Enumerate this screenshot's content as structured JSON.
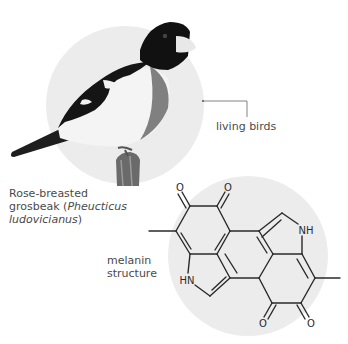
{
  "diagram": {
    "bird_section": {
      "callout_label": "living birds",
      "caption": {
        "line1": "Rose-breasted",
        "line2_prefix": "grosbeak (",
        "line2_italic": "Pheucticus",
        "line3_italic": "ludovicianus",
        "line3_suffix": ")"
      },
      "circle_color": "#ececec"
    },
    "molecule_section": {
      "caption": {
        "line1": "melanin",
        "line2": "structure"
      },
      "atom_labels": {
        "oxygen_top_left": "O",
        "oxygen_top_right": "O",
        "oxygen_bottom_left": "O",
        "oxygen_bottom_right": "O",
        "nitrogen_right": "NH",
        "nitrogen_left": "HN"
      },
      "circle_color": "#ececec"
    }
  }
}
